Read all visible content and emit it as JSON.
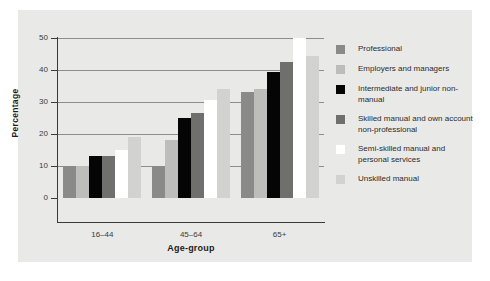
{
  "chart_data": {
    "type": "bar",
    "title": "",
    "xlabel": "Age-group",
    "ylabel": "Percentage",
    "categories": [
      "16–44",
      "45–64",
      "65+"
    ],
    "ylim": [
      0,
      50
    ],
    "yticks": [
      0,
      10,
      20,
      30,
      40,
      50
    ],
    "grid": true,
    "legend_position": "right",
    "series": [
      {
        "name": "Professional",
        "color": "#8a8a88",
        "values": [
          10.0,
          10.0,
          33.0
        ]
      },
      {
        "name": "Employers and managers",
        "color": "#bdbdbb",
        "values": [
          10.0,
          18.0,
          34.0
        ]
      },
      {
        "name": "Intermediate and junior non-manual",
        "color": "#050505",
        "values": [
          13.0,
          25.0,
          39.5
        ]
      },
      {
        "name": "Skilled manual and own account non-professional",
        "color": "#6f6f6d",
        "values": [
          13.0,
          26.5,
          42.5
        ]
      },
      {
        "name": "Semi-skilled manual and personal services",
        "color": "#ffffff",
        "values": [
          15.0,
          30.5,
          50.0
        ]
      },
      {
        "name": "Unskilled manual",
        "color": "#d2d2d0",
        "values": [
          19.0,
          34.0,
          44.5
        ]
      }
    ]
  },
  "legend": {
    "items": [
      {
        "label": "Professional"
      },
      {
        "label": "Employers and managers"
      },
      {
        "label": "Intermediate and junior non-manual"
      },
      {
        "label": "Skilled manual and own account non-professional"
      },
      {
        "label": "Semi-skilled manual and personal services"
      },
      {
        "label": "Unskilled manual"
      }
    ]
  }
}
